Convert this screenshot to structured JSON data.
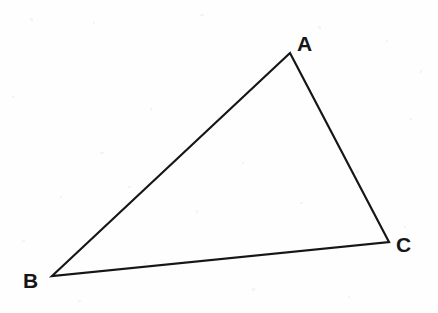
{
  "figure": {
    "kind": "geometry-diagram",
    "background_color": "#fefefe",
    "stroke_color": "#161616",
    "stroke_width": 2.2,
    "canvas": {
      "width": 438,
      "height": 313
    }
  },
  "chart_data": {
    "type": "diagram",
    "shape": "triangle",
    "xlabel": "",
    "ylabel": "",
    "xlim": [
      0,
      438
    ],
    "ylim": [
      0,
      313
    ],
    "grid": false,
    "legend": null,
    "vertices": [
      {
        "name": "A",
        "x": 290,
        "y": 53,
        "label": "A",
        "label_x": 305,
        "label_y": 44
      },
      {
        "name": "B",
        "x": 52,
        "y": 276,
        "label": "B",
        "label_x": 31,
        "label_y": 281
      },
      {
        "name": "C",
        "x": 389,
        "y": 242,
        "label": "C",
        "label_x": 404,
        "label_y": 245
      }
    ],
    "edges": [
      {
        "name": "AB",
        "from": "A",
        "to": "B"
      },
      {
        "name": "BC",
        "from": "B",
        "to": "C"
      },
      {
        "name": "CA",
        "from": "C",
        "to": "A"
      }
    ]
  },
  "labels": {
    "a": "A",
    "b": "B",
    "c": "C"
  }
}
